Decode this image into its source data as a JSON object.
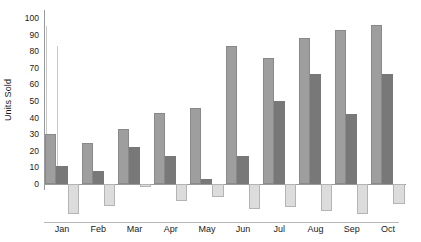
{
  "chart_data": {
    "type": "bar",
    "title": "",
    "xlabel": "",
    "ylabel": "Units Sold",
    "ylim": [
      -20,
      100
    ],
    "yticks": [
      0,
      10,
      20,
      30,
      40,
      50,
      60,
      70,
      80,
      90,
      100
    ],
    "grid": false,
    "legend": "none",
    "categories": [
      "Jan",
      "Feb",
      "Mar",
      "Apr",
      "May",
      "Jun",
      "Jul",
      "Aug",
      "Sep",
      "Oct"
    ],
    "series": [
      {
        "name": "Series 1",
        "color": "#9e9e9e",
        "values": [
          30,
          25,
          33,
          43,
          46,
          83,
          76,
          88,
          93,
          96
        ]
      },
      {
        "name": "Series 2",
        "color": "#787878",
        "values": [
          11,
          8,
          22,
          17,
          3,
          17,
          50,
          66,
          42,
          66
        ]
      },
      {
        "name": "Series 3",
        "color": "#dcdcdc",
        "values": [
          -18,
          -13,
          -2,
          -10,
          -8,
          -15,
          -14,
          -16,
          -18,
          -12
        ]
      }
    ],
    "spikes": [
      95,
      83
    ]
  }
}
